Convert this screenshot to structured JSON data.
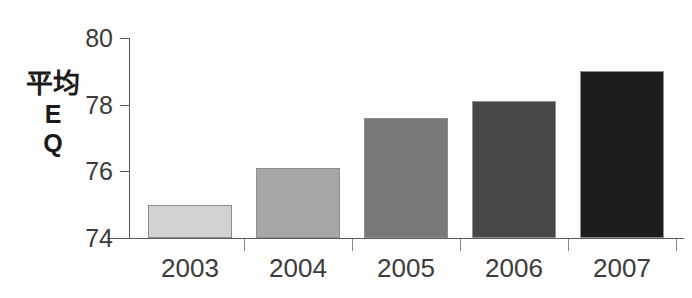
{
  "chart_data": {
    "type": "bar",
    "title": "",
    "subtitle": "",
    "xlabel": "",
    "ylabel": "平均EQ",
    "ylabel_lines": [
      "平均",
      "E",
      "Q"
    ],
    "categories": [
      "2003",
      "2004",
      "2005",
      "2006",
      "2007"
    ],
    "values": [
      75.0,
      76.1,
      77.6,
      78.1,
      79.0
    ],
    "series": [
      {
        "name": "平均EQ",
        "values": [
          75.0,
          76.1,
          77.6,
          78.1,
          79.0
        ]
      }
    ],
    "ylim": [
      74,
      80
    ],
    "yticks": [
      74,
      76,
      78,
      80
    ],
    "ytick_labels": [
      "74",
      "76",
      "78",
      "80"
    ],
    "xtick_labels": [
      "2003",
      "2004",
      "2005",
      "2006",
      "2007"
    ],
    "grid": false,
    "legend": false,
    "legend_position": "none",
    "bar_colors": [
      "#d2d2d2",
      "#a6a6a6",
      "#787878",
      "#474747",
      "#1d1d1d"
    ],
    "bar_border_color": "#8e8e8e",
    "axis_color": "#5c5c5c",
    "background_color": "#fdfdfb",
    "text_color": "#3c3c3c"
  },
  "axis": {
    "y_tick_labels": [
      "80",
      "78",
      "76",
      "74"
    ],
    "x_category_labels": [
      "2003",
      "2004",
      "2005",
      "2006",
      "2007"
    ]
  }
}
